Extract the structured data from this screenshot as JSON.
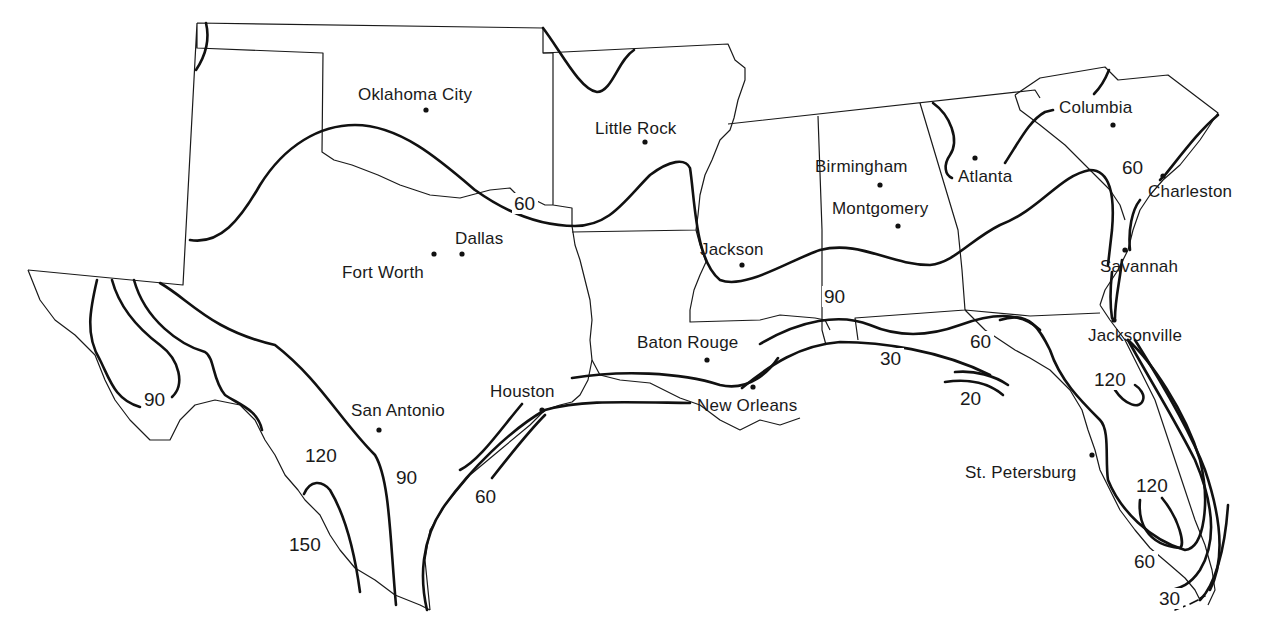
{
  "map": {
    "region": "Southern United States",
    "colors": {
      "background": "#ffffff",
      "ink": "#111111"
    },
    "cities": [
      {
        "name": "Oklahoma City",
        "dot": [
          426,
          110
        ],
        "label": [
          358,
          100
        ]
      },
      {
        "name": "Little Rock",
        "dot": [
          645,
          142
        ],
        "label": [
          595,
          134
        ]
      },
      {
        "name": "Dallas",
        "dot": [
          462,
          254
        ],
        "label": [
          455,
          244
        ]
      },
      {
        "name": "Fort Worth",
        "dot": [
          434,
          254
        ],
        "label": [
          342,
          278
        ]
      },
      {
        "name": "Jackson",
        "dot": [
          742,
          265
        ],
        "label": [
          700,
          255
        ]
      },
      {
        "name": "Birmingham",
        "dot": [
          880,
          185
        ],
        "label": [
          815,
          172
        ]
      },
      {
        "name": "Montgomery",
        "dot": [
          898,
          226
        ],
        "label": [
          832,
          214
        ]
      },
      {
        "name": "Atlanta",
        "dot": [
          975,
          158
        ],
        "label": [
          958,
          182
        ]
      },
      {
        "name": "Columbia",
        "dot": [
          1113,
          125
        ],
        "label": [
          1059,
          113
        ]
      },
      {
        "name": "Charleston",
        "dot": [
          1163,
          176
        ],
        "label": [
          1148,
          197
        ]
      },
      {
        "name": "Savannah",
        "dot": [
          1125,
          250
        ],
        "label": [
          1100,
          272
        ]
      },
      {
        "name": "Jacksonville",
        "dot": [
          1114,
          320
        ],
        "label": [
          1088,
          341
        ]
      },
      {
        "name": "Baton Rouge",
        "dot": [
          707,
          360
        ],
        "label": [
          637,
          348
        ]
      },
      {
        "name": "New Orleans",
        "dot": [
          753,
          387
        ],
        "label": [
          697,
          411
        ]
      },
      {
        "name": "Houston",
        "dot": [
          542,
          410
        ],
        "label": [
          490,
          397
        ]
      },
      {
        "name": "San Antonio",
        "dot": [
          379,
          430
        ],
        "label": [
          351,
          416
        ]
      },
      {
        "name": "St. Petersburg",
        "dot": [
          1092,
          455
        ],
        "label": [
          965,
          478
        ]
      }
    ],
    "isoline_labels": [
      {
        "text": "60",
        "pos": [
          514,
          210
        ]
      },
      {
        "text": "90",
        "pos": [
          144,
          406
        ]
      },
      {
        "text": "120",
        "pos": [
          305,
          462
        ]
      },
      {
        "text": "150",
        "pos": [
          289,
          551
        ]
      },
      {
        "text": "90",
        "pos": [
          396,
          484
        ]
      },
      {
        "text": "60",
        "pos": [
          475,
          503
        ]
      },
      {
        "text": "90",
        "pos": [
          824,
          303
        ]
      },
      {
        "text": "30",
        "pos": [
          880,
          365
        ]
      },
      {
        "text": "60",
        "pos": [
          970,
          348
        ]
      },
      {
        "text": "20",
        "pos": [
          960,
          405
        ]
      },
      {
        "text": "60",
        "pos": [
          1122,
          174
        ]
      },
      {
        "text": "120",
        "pos": [
          1094,
          386
        ]
      },
      {
        "text": "120",
        "pos": [
          1136,
          492
        ]
      },
      {
        "text": "60",
        "pos": [
          1134,
          568
        ]
      },
      {
        "text": "30",
        "pos": [
          1159,
          605
        ]
      }
    ]
  }
}
